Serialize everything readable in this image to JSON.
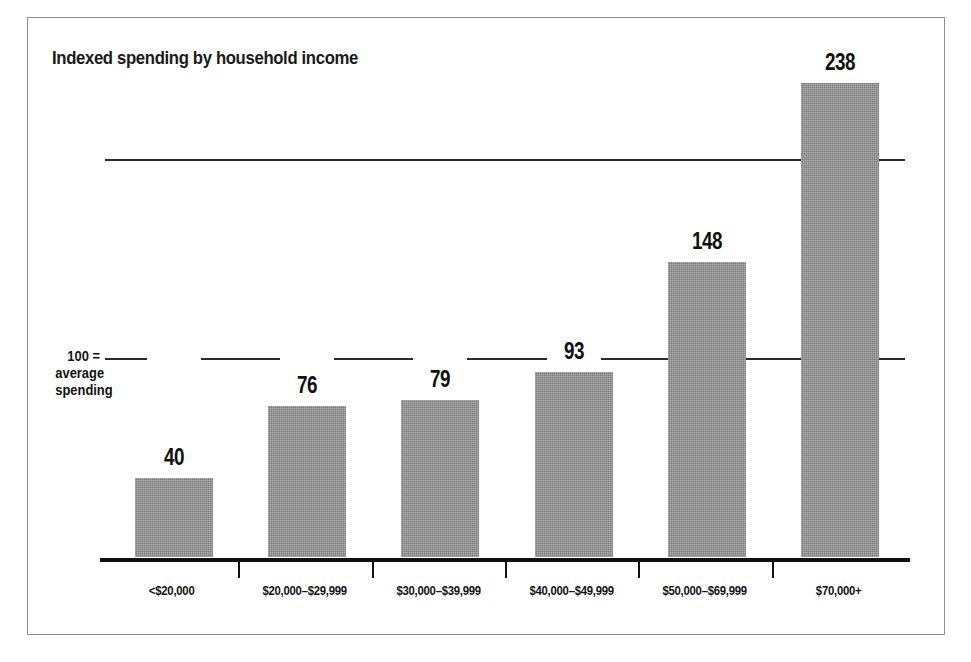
{
  "chart_data": {
    "type": "bar",
    "title": "Indexed spending by household income",
    "xlabel": "",
    "ylabel": "",
    "categories": [
      "<$20,000",
      "$20,000–$29,999",
      "$30,000–$39,999",
      "$40,000–$49,999",
      "$50,000–$69,999",
      "$70,000+"
    ],
    "values": [
      40,
      76,
      79,
      93,
      148,
      238
    ],
    "value_labels": [
      "40",
      "76",
      "79",
      "93",
      "148",
      "238"
    ],
    "ylim": [
      0,
      250
    ],
    "gridlines": [
      100,
      200
    ],
    "grid": true,
    "legend": "none",
    "annotations": [
      {
        "text_lines": [
          "100 =",
          "average",
          "spending"
        ],
        "value": 100,
        "position": "left-of-100-gridline"
      }
    ],
    "colors": {
      "bar_fill": "#8d8d8d",
      "axis": "#111111",
      "gridline": "#2b2b2b",
      "text": "#111111",
      "frame_border": "#8e8e90",
      "background": "#ffffff"
    }
  },
  "annotation": {
    "line1": "100 =",
    "line2": "average",
    "line3": "spending"
  }
}
